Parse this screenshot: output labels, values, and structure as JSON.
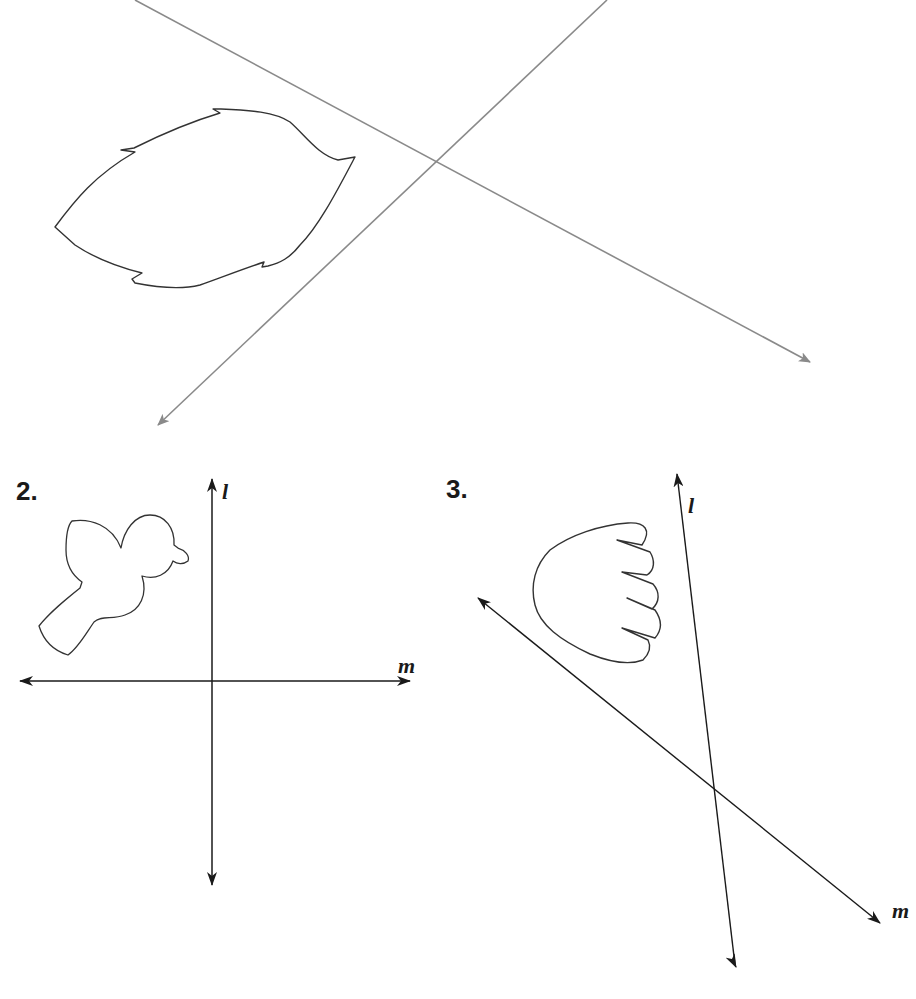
{
  "figure": {
    "colors": {
      "background": "#ffffff",
      "top_lines": "#8a8a8a",
      "outline": "#333333",
      "lines": "#1a1a1a"
    }
  },
  "example": {
    "shape": "leaf",
    "lines": [
      {
        "id": "line-a",
        "from": [
          135,
          0
        ],
        "to": [
          810,
          362
        ]
      },
      {
        "id": "line-b",
        "from": [
          607,
          0
        ],
        "to": [
          158,
          425
        ]
      }
    ],
    "intersection": [
      436,
      160
    ]
  },
  "problems": [
    {
      "number": "2.",
      "shape": "bird",
      "lines": [
        {
          "label": "l",
          "orientation": "vertical"
        },
        {
          "label": "m",
          "orientation": "horizontal"
        }
      ],
      "labels": {
        "l": "l",
        "m": "m"
      }
    },
    {
      "number": "3.",
      "shape": "wing",
      "lines": [
        {
          "label": "l",
          "orientation": "steep"
        },
        {
          "label": "m",
          "orientation": "diagonal"
        }
      ],
      "labels": {
        "l": "l",
        "m": "m"
      }
    }
  ]
}
